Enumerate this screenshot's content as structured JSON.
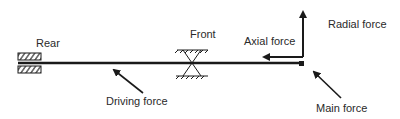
{
  "diagram": {
    "labels": {
      "rear": "Rear",
      "front": "Front",
      "axial_force": "Axial force",
      "radial_force": "Radial force",
      "driving_force": "Driving force",
      "main_force": "Main force"
    },
    "colors": {
      "stroke": "#1a1a1a",
      "text": "#2a2a2a",
      "background": "#ffffff"
    }
  }
}
